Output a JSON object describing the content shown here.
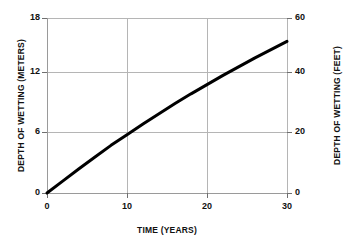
{
  "chart_data": {
    "type": "line",
    "title": "",
    "subtitle": "",
    "xlabel": "TIME (YEARS)",
    "ylabel": "DEPTH OF WETTING (METERS)",
    "y2label": "DEPTH OF WETTING (FEET)",
    "xlim": [
      0,
      30
    ],
    "ylim": [
      0,
      18
    ],
    "y2lim": [
      0,
      60
    ],
    "xticks": [
      "0",
      "10",
      "20",
      "30"
    ],
    "xtick_values": [
      0,
      10,
      20,
      30
    ],
    "yticks": [
      "0",
      "6",
      "12",
      "18"
    ],
    "ytick_values": [
      0,
      6,
      12,
      18
    ],
    "y2ticks": [
      "0",
      "20",
      "40",
      "60"
    ],
    "y2tick_values": [
      0,
      20,
      40,
      60
    ],
    "grid": true,
    "legend": "none",
    "line_color": "#000000",
    "grid_color": "#b5b5b5",
    "series": [
      {
        "name": "depth of wetting",
        "x": [
          0,
          2,
          4,
          6,
          8,
          10,
          12,
          14,
          16,
          18,
          20,
          22,
          24,
          26,
          28,
          30
        ],
        "values": [
          0.0,
          1.25,
          2.5,
          3.7,
          4.9,
          6.0,
          7.1,
          8.15,
          9.2,
          10.2,
          11.15,
          12.1,
          13.0,
          13.9,
          14.75,
          15.6
        ]
      }
    ],
    "annotations": []
  }
}
